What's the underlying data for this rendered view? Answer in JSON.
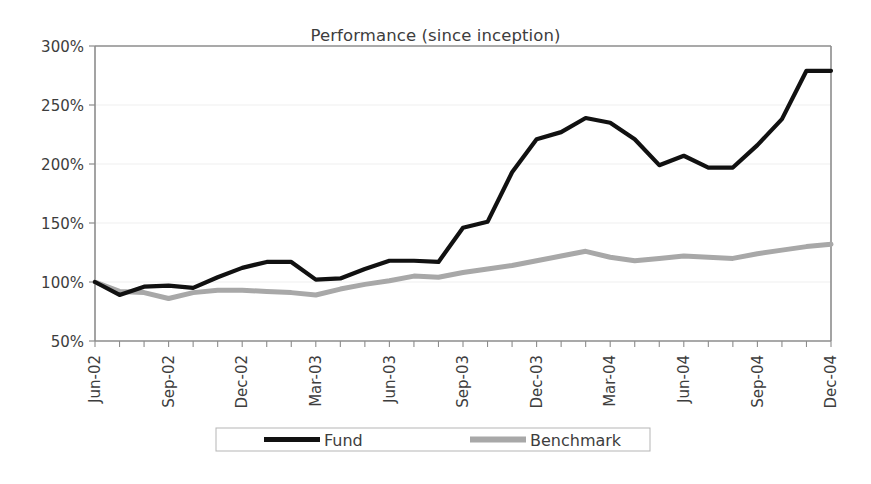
{
  "chart_data": {
    "type": "line",
    "title": "Performance (since inception)",
    "xlabel": "",
    "ylabel": "",
    "ylim": [
      50,
      300
    ],
    "ytick_values": [
      50,
      100,
      150,
      200,
      250,
      300
    ],
    "ytick_labels": [
      "50%",
      "100%",
      "150%",
      "200%",
      "250%",
      "300%"
    ],
    "grid": true,
    "legend_position": "bottom",
    "x": [
      "Jun-02",
      "Jul-02",
      "Aug-02",
      "Sep-02",
      "Oct-02",
      "Nov-02",
      "Dec-02",
      "Jan-03",
      "Feb-03",
      "Mar-03",
      "Apr-03",
      "May-03",
      "Jun-03",
      "Jul-03",
      "Aug-03",
      "Sep-03",
      "Oct-03",
      "Nov-03",
      "Dec-03",
      "Jan-04",
      "Feb-04",
      "Mar-04",
      "Apr-04",
      "May-04",
      "Jun-04",
      "Jul-04",
      "Aug-04",
      "Sep-04",
      "Oct-04",
      "Nov-04",
      "Dec-04"
    ],
    "xtick_labels": [
      "Jun-02",
      "Sep-02",
      "Dec-02",
      "Mar-03",
      "Jun-03",
      "Sep-03",
      "Dec-03",
      "Mar-04",
      "Jun-04",
      "Sep-04",
      "Dec-04"
    ],
    "xtick_indices": [
      0,
      3,
      6,
      9,
      12,
      15,
      18,
      21,
      24,
      27,
      30
    ],
    "series": [
      {
        "name": "Fund",
        "color": "#111111",
        "values": [
          100,
          89,
          96,
          97,
          95,
          104,
          112,
          117,
          117,
          102,
          103,
          111,
          118,
          118,
          117,
          146,
          151,
          193,
          221,
          227,
          239,
          235,
          221,
          199,
          207,
          197,
          197,
          216,
          238,
          279,
          279
        ]
      },
      {
        "name": "Benchmark",
        "color": "#a8a8a8",
        "values": [
          100,
          92,
          91,
          86,
          91,
          93,
          93,
          92,
          91,
          89,
          94,
          98,
          101,
          105,
          104,
          108,
          111,
          114,
          118,
          122,
          126,
          121,
          118,
          120,
          122,
          121,
          120,
          124,
          127,
          130,
          132
        ]
      }
    ],
    "legend": [
      {
        "label": "Fund",
        "color": "#111111"
      },
      {
        "label": "Benchmark",
        "color": "#a8a8a8"
      }
    ]
  },
  "colors": {
    "axis": "#8c8c8c",
    "grid": "#efefef",
    "text": "#3d3d3d",
    "background": "#ffffff",
    "legend_border": "#b5b5b5"
  }
}
